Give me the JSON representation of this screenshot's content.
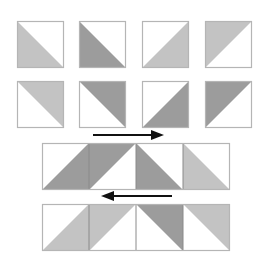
{
  "diagram": {
    "colors": {
      "background": "#ffffff",
      "light": "#c3c3c3",
      "dark": "#9c9c9c",
      "white": "#ffffff",
      "border": "#b5b5b5",
      "seam": "#8a8a8a",
      "arrow": "#111111"
    },
    "single_blocks": [
      {
        "row": 1,
        "x": 17,
        "y": 21,
        "size": 47,
        "half": "lower-left",
        "tone": "light"
      },
      {
        "row": 1,
        "x": 79,
        "y": 21,
        "size": 47,
        "half": "lower-left",
        "tone": "dark"
      },
      {
        "row": 1,
        "x": 142,
        "y": 21,
        "size": 47,
        "half": "lower-right",
        "tone": "light"
      },
      {
        "row": 1,
        "x": 205,
        "y": 21,
        "size": 47,
        "half": "upper-left",
        "tone": "light"
      },
      {
        "row": 2,
        "x": 17,
        "y": 81,
        "size": 47,
        "half": "upper-right",
        "tone": "light"
      },
      {
        "row": 2,
        "x": 79,
        "y": 81,
        "size": 47,
        "half": "upper-right",
        "tone": "dark"
      },
      {
        "row": 2,
        "x": 142,
        "y": 81,
        "size": 47,
        "half": "lower-right",
        "tone": "dark"
      },
      {
        "row": 2,
        "x": 205,
        "y": 81,
        "size": 47,
        "half": "upper-left",
        "tone": "dark"
      }
    ],
    "strips": [
      {
        "name": "strip-row-1",
        "x": 42,
        "y": 143,
        "size": 47,
        "blocks": [
          {
            "half": "lower-right",
            "tone": "dark"
          },
          {
            "half": "upper-left",
            "tone": "dark"
          },
          {
            "half": "lower-left",
            "tone": "dark"
          },
          {
            "half": "lower-left",
            "tone": "light"
          }
        ]
      },
      {
        "name": "strip-row-2",
        "x": 42,
        "y": 204,
        "size": 47,
        "blocks": [
          {
            "half": "lower-right",
            "tone": "light"
          },
          {
            "half": "upper-left",
            "tone": "light"
          },
          {
            "half": "upper-right",
            "tone": "dark"
          },
          {
            "half": "upper-right",
            "tone": "light"
          }
        ]
      }
    ],
    "arrows": [
      {
        "name": "press-right-arrow",
        "direction": "right",
        "x1": 93,
        "x2": 164,
        "y": 135
      },
      {
        "name": "press-left-arrow",
        "direction": "left",
        "x1": 101,
        "x2": 172,
        "y": 196
      }
    ]
  }
}
